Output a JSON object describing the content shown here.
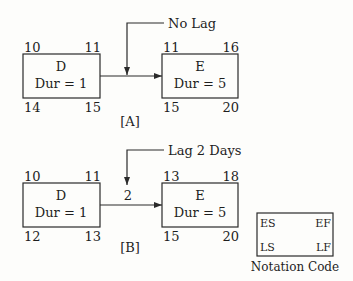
{
  "diagram_a": {
    "caption": "[A]",
    "lag_label": "No Lag",
    "predecessor": {
      "name": "D",
      "duration": "Dur = 1",
      "es": "10",
      "ef": "11",
      "ls": "14",
      "lf": "15"
    },
    "successor": {
      "name": "E",
      "duration": "Dur = 5",
      "es": "11",
      "ef": "16",
      "ls": "15",
      "lf": "20"
    }
  },
  "diagram_b": {
    "caption": "[B]",
    "lag_label": "Lag 2 Days",
    "lag_value": "2",
    "predecessor": {
      "name": "D",
      "duration": "Dur = 1",
      "es": "10",
      "ef": "11",
      "ls": "12",
      "lf": "13"
    },
    "successor": {
      "name": "E",
      "duration": "Dur = 5",
      "es": "13",
      "ef": "18",
      "ls": "15",
      "lf": "20"
    }
  },
  "notation": {
    "es": "ES",
    "ef": "EF",
    "ls": "LS",
    "lf": "LF",
    "caption": "Notation Code"
  },
  "colors": {
    "line": "#2a2a2a",
    "background": "#fdfdfb"
  }
}
